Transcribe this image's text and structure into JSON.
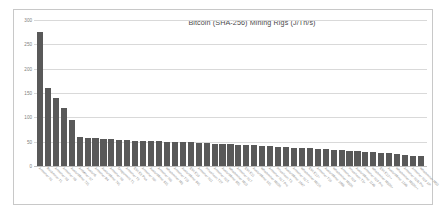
{
  "chart_data": {
    "type": "bar",
    "title": "Bitcoin (SHA-256) Mining Rigs (J/Th/s)",
    "xlabel": "",
    "ylabel": "",
    "ylim": [
      0,
      300
    ],
    "yticks": [
      300,
      250,
      200,
      150,
      100,
      50,
      0
    ],
    "grid": true,
    "legend": false,
    "bar_color": "#595959",
    "categories": [
      "Antminer S1",
      "Rockminer T1",
      "Antminer S3",
      "Antminer S5",
      "AvalonMiner 721",
      "AntMiner S7",
      "Avalon6",
      "Antminer R4",
      "AvalonMiner 741",
      "Antminer S9",
      "Dragonmint T1",
      "Antminer T9",
      "Ebit E9 Plus",
      "Antminer S9i",
      "AvalonMiner 821",
      "Antminer S9j",
      "Whatsminer M3",
      "Antminer T15",
      "AvalonMiner 841",
      "Ebit E10",
      "Antminer S11",
      "Innosilicon T2T",
      "Antminer S15",
      "AvalonMiner 851",
      "Whatsminer M10",
      "Antminer S17",
      "Ebit E11",
      "AvalonMiner 921",
      "Whatsminer M20S",
      "Antminer S17 Pro",
      "Innosilicon T3",
      "AvalonMiner 1047",
      "Antminer S17+",
      "Whatsminer M21S",
      "Ebit E12+",
      "Antminer T19",
      "AvalonMiner 1066",
      "Whatsminer M30S",
      "Antminer S19",
      "Innosilicon T3+",
      "AvalonMiner 1146",
      "Antminer S19 Pro",
      "Whatsminer M30S+",
      "Ebit E12++",
      "AvalonMiner 1246",
      "Whatsminer M30S++",
      "Antminer S19j Pro",
      "Antminer S19 XP",
      "Whatsminer M50"
    ],
    "values": [
      275,
      160,
      140,
      120,
      95,
      60,
      58,
      57,
      56,
      55,
      54,
      53,
      52,
      52,
      51,
      51,
      50,
      50,
      49,
      49,
      48,
      47,
      46,
      45,
      45,
      44,
      44,
      43,
      42,
      41,
      40,
      39,
      38,
      37,
      36,
      35,
      34,
      33,
      32,
      31,
      30,
      29,
      28,
      27,
      26,
      25,
      22,
      21,
      21
    ]
  }
}
